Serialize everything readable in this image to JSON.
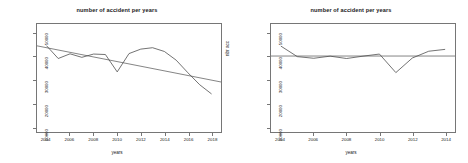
{
  "figure": {
    "background": "#ffffff",
    "axis_color": "#767676",
    "series_color": "#4d4d4d",
    "trend_color": "#4d4d4d"
  },
  "panels": [
    {
      "name": "left-panel",
      "chart_data": {
        "type": "line",
        "title": "number of accident per years",
        "xlabel": "years",
        "ylabel": "nbr acc",
        "xlim": [
          2003.2,
          2018.8
        ],
        "ylim": [
          8000,
          54000
        ],
        "grid": false,
        "legend": null,
        "xticks": [
          "2004",
          "2006",
          "2008",
          "2010",
          "2012",
          "2014",
          "2016",
          "2018"
        ],
        "xtick_values": [
          2004,
          2006,
          2008,
          2010,
          2012,
          2014,
          2016,
          2018
        ],
        "yticks": [
          "10000",
          "20000",
          "30000",
          "40000",
          "50000"
        ],
        "ytick_values": [
          10000,
          20000,
          30000,
          40000,
          50000
        ],
        "x": [
          2004,
          2005,
          2006,
          2007,
          2008,
          2009,
          2010,
          2011,
          2012,
          2013,
          2014,
          2015,
          2016,
          2017,
          2018
        ],
        "series": [
          {
            "name": "number of accidents",
            "values": [
              44800,
              39300,
              41300,
              39800,
              41200,
              41000,
              33600,
              41400,
              43300,
              43900,
              42300,
              38600,
              33200,
              28100,
              24200
            ]
          },
          {
            "name": "linear trend",
            "type": "trend",
            "x": [
              2003.2,
              2018.8
            ],
            "values": [
              44700,
              29300
            ]
          }
        ]
      }
    },
    {
      "name": "right-panel",
      "chart_data": {
        "type": "line",
        "title": "number of accident per years",
        "xlabel": "years",
        "ylabel": "nbr acc",
        "xlim": [
          2003.4,
          2014.6
        ],
        "ylim": [
          8000,
          54000
        ],
        "grid": false,
        "legend": null,
        "xticks": [
          "2004",
          "2006",
          "2008",
          "2010",
          "2012",
          "2014"
        ],
        "xtick_values": [
          2004,
          2006,
          2008,
          2010,
          2012,
          2014
        ],
        "yticks": [
          "10000",
          "20000",
          "30000",
          "40000",
          "50000"
        ],
        "ytick_values": [
          10000,
          20000,
          30000,
          40000,
          50000
        ],
        "x": [
          2004,
          2005,
          2006,
          2007,
          2008,
          2009,
          2010,
          2011,
          2012,
          2013,
          2014
        ],
        "series": [
          {
            "name": "number of accidents",
            "values": [
              44600,
              40100,
              39400,
              40300,
              39300,
              40300,
              41200,
              33300,
              39500,
              42400,
              43200
            ]
          },
          {
            "name": "linear trend",
            "type": "trend",
            "x": [
              2003.4,
              2014.6
            ],
            "values": [
              40350,
              40350
            ]
          }
        ]
      }
    }
  ]
}
